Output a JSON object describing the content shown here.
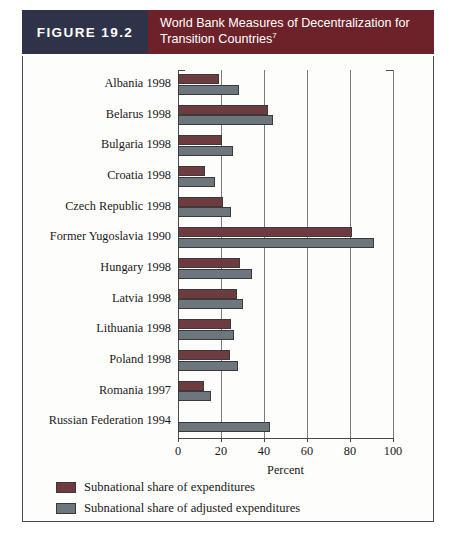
{
  "figure": {
    "tag": "FIGURE 19.2",
    "title_line1": "World Bank Measures of Decentralization for",
    "title_line2": "Transition Countries",
    "footnote_marker": "7",
    "tag_bg": "#2e3349",
    "title_bg": "#6d222a"
  },
  "chart_data": {
    "type": "bar",
    "orientation": "horizontal",
    "title": "World Bank Measures of Decentralization for Transition Countries",
    "xlabel": "Percent",
    "ylabel": "",
    "xlim": [
      0,
      100
    ],
    "xticks": [
      0,
      20,
      40,
      60,
      80,
      100
    ],
    "xticklabels": [
      "0",
      "20",
      "40",
      "60",
      "80",
      "100"
    ],
    "grid": "vertical",
    "legend_position": "below-left",
    "categories": [
      "Albania 1998",
      "Belarus 1998",
      "Bulgaria 1998",
      "Croatia 1998",
      "Czech Republic 1998",
      "Former Yugoslavia 1990",
      "Hungary 1998",
      "Latvia 1998",
      "Lithuania 1998",
      "Poland 1998",
      "Romania 1997",
      "Russian Federation 1994"
    ],
    "series": [
      {
        "name": "Subnational share of expenditures",
        "color": "#6e3c40",
        "values": [
          19,
          42,
          20.5,
          12.5,
          21,
          81,
          29,
          27.5,
          24.5,
          24,
          12,
          null
        ]
      },
      {
        "name": "Subnational share of adjusted expenditures",
        "color": "#6d767d",
        "values": [
          28.5,
          44,
          25.5,
          17,
          24.5,
          91,
          34.5,
          30,
          26,
          28,
          15.5,
          43
        ]
      }
    ]
  },
  "legend": {
    "items": [
      {
        "label": "Subnational share of expenditures",
        "swatch": "primary"
      },
      {
        "label": "Subnational share of adjusted expenditures",
        "swatch": "secondary"
      }
    ]
  }
}
